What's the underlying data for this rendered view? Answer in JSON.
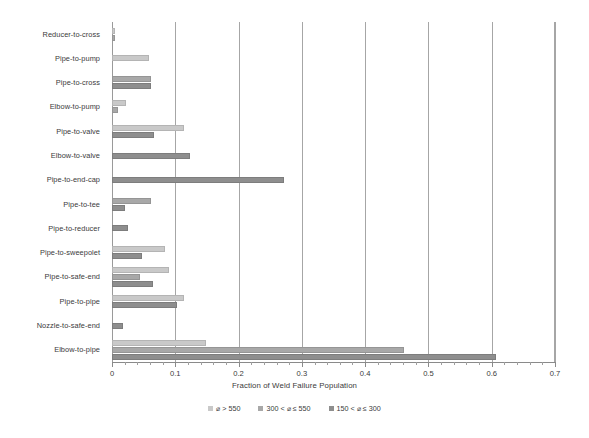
{
  "chart_data": {
    "type": "bar",
    "orientation": "horizontal",
    "title": "",
    "xlabel": "Fraction of Weld Failure Population",
    "ylabel": "",
    "xlim": [
      0,
      0.7
    ],
    "xticks": [
      "0",
      "0.1",
      "0.2",
      "0.3",
      "0.4",
      "0.5",
      "0.6",
      "0.7"
    ],
    "xtick_values": [
      0,
      0.1,
      0.2,
      0.3,
      0.4,
      0.5,
      0.6,
      0.7
    ],
    "minor_tick_step": 0.02,
    "grid": "vertical-major",
    "legend_position": "bottom",
    "categories": [
      "Reducer-to-cross",
      "Pipe-to-pump",
      "Pipe-to-cross",
      "Elbow-to-pump",
      "Pipe-to-valve",
      "Elbow-to-valve",
      "Pipe-to-end-cap",
      "Pipe-to-tee",
      "Pipe-to-reducer",
      "Pipe-to-sweepolet",
      "Pipe-to-safe-end",
      "Pipe-to-pipe",
      "Nozzle-to-safe-end",
      "Elbow-to-pipe"
    ],
    "series": [
      {
        "name": "⌀ > 550",
        "color": "#c9c9c9",
        "values": [
          0.004,
          0.058,
          0.0,
          0.022,
          0.114,
          0.0,
          0.0,
          0.0,
          0.0,
          0.084,
          0.09,
          0.114,
          0.0,
          0.148
        ]
      },
      {
        "name": "300 < ⌀ ≤ 550",
        "color": "#a8a8a8",
        "values": [
          0.004,
          0.0,
          0.062,
          0.01,
          0.0,
          0.0,
          0.0,
          0.062,
          0.0,
          0.0,
          0.045,
          0.0,
          0.0,
          0.462
        ]
      },
      {
        "name": "150 < ⌀ ≤ 300",
        "color": "#8e8e8e",
        "values": [
          0.0,
          0.0,
          0.062,
          0.0,
          0.066,
          0.124,
          0.272,
          0.02,
          0.026,
          0.048,
          0.064,
          0.102,
          0.018,
          0.606
        ]
      }
    ]
  },
  "legend": {
    "items": [
      {
        "label": "⌀ > 550"
      },
      {
        "label": "300 < ⌀ ≤ 550"
      },
      {
        "label": "150 < ⌀ ≤ 300"
      }
    ]
  }
}
